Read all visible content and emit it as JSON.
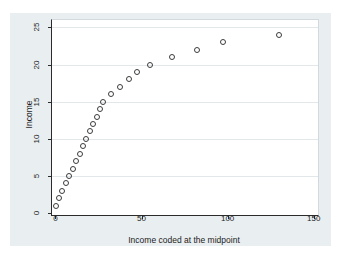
{
  "window": {
    "background": "#ffffff"
  },
  "graph": {
    "background": "#e9eef0",
    "plot_background": "#ffffff",
    "gridline_color": "#e2e7e9",
    "axis_color": "#2b2b2b",
    "text_color": "#1c1c1c",
    "marker_color": "#3c3c3c"
  },
  "chart_data": {
    "type": "scatter",
    "title": "",
    "xlabel": "Income coded at the midpoint",
    "ylabel": "Income",
    "xticks": [
      0,
      50,
      100,
      150
    ],
    "yticks": [
      0,
      5,
      10,
      15,
      20,
      25
    ],
    "xlim": [
      -2,
      152.5
    ],
    "ylim": [
      -0.25,
      26
    ],
    "grid": "horizontal-only",
    "legend": "none",
    "marker": "hollow-circle",
    "series": [
      {
        "name": "income-midpoints",
        "x": [
          0.5,
          2,
          4,
          6,
          8,
          10,
          12,
          14,
          16,
          18,
          20,
          22,
          24,
          26,
          27.5,
          32.5,
          37.5,
          42.5,
          47.5,
          55,
          67.5,
          82.5,
          97.5,
          130
        ],
        "y": [
          1,
          2,
          3,
          4,
          5,
          6,
          7,
          8,
          9,
          10,
          11,
          12,
          13,
          14,
          15,
          16,
          17,
          18,
          19,
          20,
          21,
          22,
          23,
          24
        ]
      }
    ]
  }
}
